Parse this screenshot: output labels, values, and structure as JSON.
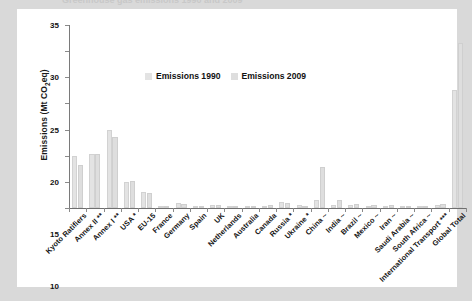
{
  "page": {
    "background_color": "#d9d9d9",
    "card_color": "#ffffff",
    "ghost_title": "Greenhouse gas emissions 1990 and 2009"
  },
  "legend": {
    "position": "inside-top-center",
    "items": [
      {
        "label": "Emissions 1990",
        "color": "#e3e3e3"
      },
      {
        "label": "Emissions 2009",
        "color": "#dedede"
      }
    ]
  },
  "chart_data": {
    "type": "bar",
    "title": "",
    "xlabel": "",
    "ylabel": "Emissions (Mt CO2eq)",
    "ylabel_html": "Emissions (Mt CO<sub>2</sub>eq)",
    "ylim": [
      0,
      35
    ],
    "yticks": [
      0,
      5,
      10,
      15,
      20,
      25,
      30,
      35
    ],
    "grid": false,
    "legend_position": "inside-top-center",
    "categories": [
      "Kyoto Ratifiers",
      "Annex II **",
      "Annex I **",
      "USA *",
      "EU-15",
      "France",
      "Germany",
      "Spain",
      "UK",
      "Netherlands",
      "Australia",
      "Canada",
      "Russia *",
      "Ukraine *",
      "China ~",
      "India ~",
      "Brazil ~",
      "Mexico ~",
      "Iran ~",
      "Saudi Arabia ~",
      "South Africa ~",
      "International Transport ***",
      "Global Total"
    ],
    "series": [
      {
        "name": "Emissions 1990",
        "color": "#e3e3e3",
        "values": [
          10.0,
          10.3,
          15.0,
          4.9,
          3.0,
          0.4,
          0.9,
          0.2,
          0.6,
          0.2,
          0.3,
          0.4,
          1.1,
          0.6,
          1.5,
          0.6,
          0.5,
          0.3,
          0.15,
          0.1,
          0.25,
          0.5,
          22.5
        ]
      },
      {
        "name": "Emissions 2009",
        "color": "#dedede",
        "values": [
          8.2,
          10.4,
          13.6,
          5.2,
          2.8,
          0.35,
          0.8,
          0.3,
          0.5,
          0.2,
          0.4,
          0.55,
          0.9,
          0.25,
          7.8,
          1.5,
          0.7,
          0.5,
          0.5,
          0.4,
          0.4,
          0.8,
          31.5
        ]
      }
    ]
  },
  "footnotes": {
    "single_star": "*",
    "double_star": "**",
    "triple_star": "***",
    "tilde": "~"
  }
}
